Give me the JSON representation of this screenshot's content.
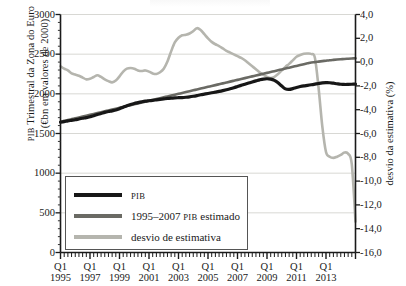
{
  "chart_data": {
    "type": "line",
    "title": "",
    "xlabel": "",
    "ylabel": "PIB Trimestral da Zona do Euro (€bn em valores de 2000)",
    "ylabel_left_line1": "PIB Trimestral da Zona do Euro",
    "ylabel_left_line2": "(€bn em valores de 2000)",
    "ylabel_right": "desvio da estimativa (%)",
    "ylim": [
      0,
      3000
    ],
    "ylim_right": [
      -16.0,
      4.0
    ],
    "yticks": [
      0,
      500,
      1000,
      1500,
      2000,
      2500,
      3000
    ],
    "yticklabels": [
      "0",
      "500",
      "1000",
      "1500",
      "2000",
      "2500",
      "3000"
    ],
    "yticks_right": [
      -16.0,
      -14.0,
      -12.0,
      -10.0,
      -8.0,
      -6.0,
      -4.0,
      -2.0,
      0.0,
      2.0,
      4.0
    ],
    "yticklabels_right": [
      "-16,0",
      "-14,0",
      "-12,0",
      "-10,0",
      "-8,0",
      "-6,0",
      "-4,0",
      "-2,0",
      "0,0",
      "2,0",
      "4,0"
    ],
    "grid": true,
    "grid_axis": "y",
    "legend_position": "lower left",
    "xticklabels": [
      {
        "q": "Q1",
        "year": "1995"
      },
      {
        "q": "Q1",
        "year": "1997"
      },
      {
        "q": "Q1",
        "year": "1999"
      },
      {
        "q": "Q1",
        "year": "2001"
      },
      {
        "q": "Q1",
        "year": "2003"
      },
      {
        "q": "Q1",
        "year": "2005"
      },
      {
        "q": "Q1",
        "year": "2007"
      },
      {
        "q": "Q1",
        "year": "2009"
      },
      {
        "q": "Q1",
        "year": "2011"
      },
      {
        "q": "Q1",
        "year": "2013"
      }
    ],
    "x_start": "1995Q1",
    "x_end": "2014Q1",
    "x_tick_interval_quarters": 8,
    "x_minor_tick_interval_quarters": 1,
    "series": [
      {
        "name": "PIB",
        "legend_label": "PIB",
        "color": "#171717",
        "axis": "left",
        "width": 3.2,
        "values": [
          1642,
          1650,
          1659,
          1666,
          1673,
          1683,
          1692,
          1700,
          1712,
          1724,
          1739,
          1752,
          1766,
          1777,
          1786,
          1796,
          1812,
          1832,
          1851,
          1866,
          1879,
          1889,
          1899,
          1908,
          1913,
          1918,
          1924,
          1930,
          1936,
          1942,
          1946,
          1949,
          1951,
          1953,
          1957,
          1962,
          1969,
          1978,
          1988,
          1996,
          2004,
          2013,
          2022,
          2031,
          2041,
          2052,
          2064,
          2077,
          2092,
          2107,
          2122,
          2136,
          2150,
          2163,
          2176,
          2186,
          2190,
          2186,
          2170,
          2140,
          2098,
          2062,
          2056,
          2066,
          2080,
          2092,
          2101,
          2107,
          2114,
          2122,
          2130,
          2137,
          2141,
          2140,
          2134,
          2127,
          2121,
          2118,
          2119,
          2121,
          2123
        ]
      },
      {
        "name": "1995–2007 PIB estimado",
        "legend_label": "1995–2007 PIB estimado",
        "color": "#6a6a64",
        "axis": "left",
        "width": 2.6,
        "values": [
          1648,
          1659,
          1670,
          1681,
          1692,
          1703,
          1714,
          1725,
          1736,
          1747,
          1758,
          1769,
          1780,
          1791,
          1802,
          1813,
          1824,
          1835,
          1846,
          1857,
          1868,
          1879,
          1890,
          1901,
          1912,
          1923,
          1934,
          1945,
          1956,
          1967,
          1978,
          1989,
          2000,
          2011,
          2022,
          2033,
          2044,
          2055,
          2066,
          2077,
          2088,
          2099,
          2110,
          2121,
          2132,
          2143,
          2154,
          2165,
          2176,
          2187,
          2198,
          2209,
          2220,
          2231,
          2242,
          2253,
          2264,
          2275,
          2286,
          2297,
          2308,
          2319,
          2330,
          2341,
          2352,
          2363,
          2374,
          2385,
          2396,
          2400,
          2406,
          2412,
          2418,
          2424,
          2428,
          2432,
          2436,
          2440,
          2443,
          2446,
          2449
        ]
      },
      {
        "name": "desvio de estimativa",
        "legend_label": "desvio de estimativa",
        "color": "#b5b5ae",
        "axis": "right",
        "width": 2.6,
        "values": [
          -0.35,
          -0.55,
          -0.7,
          -0.95,
          -1.05,
          -1.15,
          -1.3,
          -1.45,
          -1.4,
          -1.25,
          -1.1,
          -1.25,
          -1.45,
          -1.6,
          -1.7,
          -1.55,
          -1.2,
          -0.8,
          -0.55,
          -0.5,
          -0.55,
          -0.7,
          -0.75,
          -0.7,
          -0.8,
          -0.95,
          -1.0,
          -0.85,
          -0.55,
          0.05,
          0.9,
          1.65,
          2.05,
          2.25,
          2.3,
          2.4,
          2.6,
          2.85,
          2.7,
          2.35,
          2.0,
          1.7,
          1.5,
          1.35,
          1.15,
          0.95,
          0.8,
          0.65,
          0.5,
          0.35,
          0.15,
          -0.1,
          -0.35,
          -0.6,
          -0.85,
          -1.05,
          -1.25,
          -1.35,
          -1.25,
          -1.0,
          -0.7,
          -0.4,
          -0.15,
          0.15,
          0.45,
          0.6,
          0.7,
          0.72,
          0.68,
          0.35,
          -2.2,
          -5.4,
          -7.55,
          -7.95,
          -8.05,
          -7.95,
          -7.8,
          -7.6,
          -7.7,
          -8.6,
          -13.4
        ]
      }
    ]
  }
}
